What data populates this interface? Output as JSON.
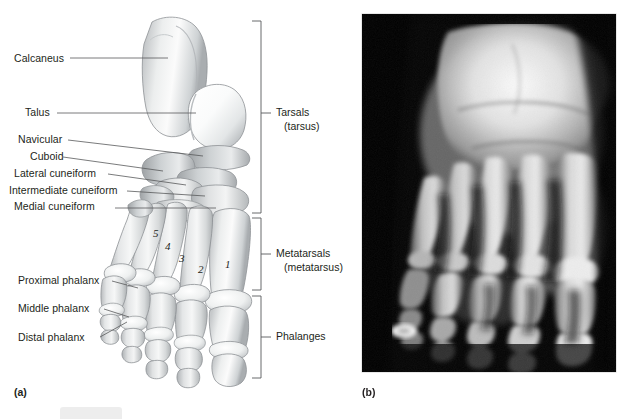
{
  "figure": {
    "panel_a_tag": "(a)",
    "panel_b_tag": "(b)",
    "background_color": "#ffffff",
    "text_color": "#231f20",
    "leader_line_color": "#58595b"
  },
  "panel_a": {
    "title": "Bones of the right foot, superior view",
    "labels": [
      {
        "id": "calcaneus",
        "text": "Calcaneus",
        "x": 14,
        "y": 52,
        "leader_to_x": 168,
        "leader_to_y": 58
      },
      {
        "id": "talus",
        "text": "Talus",
        "x": 25,
        "y": 106,
        "leader_to_x": 196,
        "leader_to_y": 113
      },
      {
        "id": "navicular",
        "text": "Navicular",
        "x": 18,
        "y": 133,
        "leader_to_x": 203,
        "leader_to_y": 148
      },
      {
        "id": "cuboid",
        "text": "Cuboid",
        "x": 30,
        "y": 150,
        "leader_to_x": 163,
        "leader_to_y": 165
      },
      {
        "id": "lateral-cuneiform",
        "text": "Lateral cuneiform",
        "x": 14,
        "y": 167,
        "leader_to_x": 186,
        "leader_to_y": 181
      },
      {
        "id": "intermediate-cuneiform",
        "text": "Intermediate cuneiform",
        "x": 9,
        "y": 184,
        "leader_to_x": 205,
        "leader_to_y": 192
      },
      {
        "id": "medial-cuneiform",
        "text": "Medial cuneiform",
        "x": 14,
        "y": 200,
        "leader_to_x": 216,
        "leader_to_y": 205
      },
      {
        "id": "proximal-phalanx",
        "text": "Proximal phalanx",
        "x": 18,
        "y": 274,
        "leader_to_x": 138,
        "leader_to_y": 283
      },
      {
        "id": "middle-phalanx",
        "text": "Middle phalanx",
        "x": 18,
        "y": 302,
        "leader_to_x": 131,
        "leader_to_y": 313
      },
      {
        "id": "distal-phalanx",
        "text": "Distal phalanx",
        "x": 18,
        "y": 331,
        "leader_to_x": 132,
        "leader_to_y": 322
      }
    ],
    "metatarsal_numbers": [
      {
        "id": "metatarsal-5",
        "text": "5",
        "x": 153,
        "y": 227
      },
      {
        "id": "metatarsal-4",
        "text": "4",
        "x": 165,
        "y": 240
      },
      {
        "id": "metatarsal-3",
        "text": "3",
        "x": 179,
        "y": 252
      },
      {
        "id": "metatarsal-2",
        "text": "2",
        "x": 198,
        "y": 263
      },
      {
        "id": "metatarsal-1",
        "text": "1",
        "x": 225,
        "y": 258
      }
    ],
    "brackets": [
      {
        "id": "tarsals",
        "name": "Tarsals",
        "sub": "(tarsus)",
        "top": 21,
        "bottom": 213,
        "x": 261,
        "label_x": 276,
        "label_y": 106
      },
      {
        "id": "metatarsals",
        "name": "Metatarsals",
        "sub": "(metatarsus)",
        "top": 218,
        "bottom": 290,
        "x": 261,
        "label_x": 276,
        "label_y": 247
      },
      {
        "id": "phalanges",
        "name": "Phalanges",
        "sub": "",
        "top": 296,
        "bottom": 378,
        "x": 261,
        "label_x": 276,
        "label_y": 330
      }
    ]
  },
  "panel_b": {
    "title": "Radiograph (X-ray) of the foot, anteroposterior view",
    "image_type": "radiograph",
    "frame": {
      "x": 362,
      "y": 14,
      "width": 254,
      "height": 358
    },
    "background_color": "#000000"
  }
}
